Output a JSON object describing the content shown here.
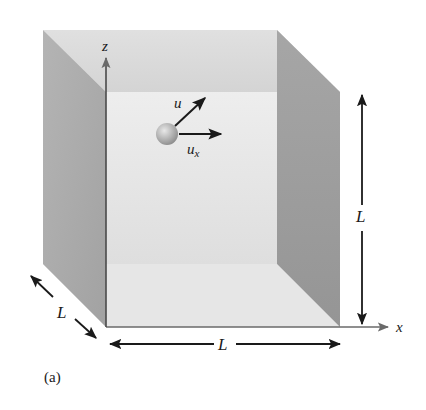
{
  "figure": {
    "caption": "(a)",
    "axes": {
      "z_label": "z",
      "x_label": "x"
    },
    "dimensions": {
      "height_label": "L",
      "width_label": "L",
      "depth_label": "L"
    },
    "particle": {
      "velocity_label": "u",
      "velocity_x_label": "u",
      "velocity_x_subscript": "x"
    },
    "colors": {
      "left_wall": "#a8a8a8",
      "right_wall": "#9a9a9a",
      "top_wall": "#dcdcdc",
      "back_wall": "#ececec",
      "floor": "#e4e4e4",
      "particle": "#b8b8b8",
      "arrows": "#1a1a1a",
      "axis": "#5a5a5a"
    }
  }
}
